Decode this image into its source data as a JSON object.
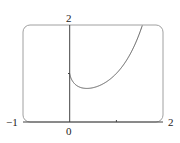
{
  "chart_data": {
    "type": "line",
    "title": "",
    "function": "y = x^x",
    "xlabel": "",
    "ylabel": "",
    "xlim": [
      -1,
      2
    ],
    "ylim": [
      0,
      2
    ],
    "grid": false,
    "legend": null,
    "tick_labels": {
      "x_min": "-1",
      "x_zero": "0",
      "x_max": "2",
      "y_max": "2"
    },
    "x": [
      0.0,
      0.05,
      0.1,
      0.2,
      0.3,
      0.368,
      0.5,
      0.7,
      0.9,
      1.0,
      1.2,
      1.4,
      1.56
    ],
    "series": [
      {
        "name": "x^x",
        "values": [
          1.0,
          0.861,
          0.794,
          0.725,
          0.697,
          0.692,
          0.707,
          0.779,
          0.91,
          1.0,
          1.245,
          1.602,
          2.0
        ]
      }
    ],
    "colors": {
      "curve": "#555555",
      "axis": "#444444",
      "frame": "#999999"
    }
  },
  "labels": {
    "x_min": "−1",
    "x_zero": "0",
    "x_max": "2",
    "y_max": "2"
  }
}
